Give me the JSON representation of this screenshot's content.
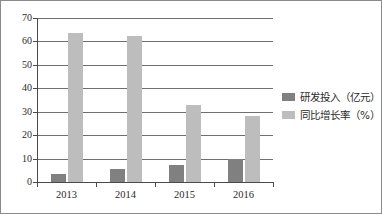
{
  "chart_data": {
    "type": "bar",
    "title": "",
    "subtitle": "",
    "xlabel": "",
    "ylabel": "",
    "categories": [
      "2013",
      "2014",
      "2015",
      "2016"
    ],
    "series": [
      {
        "name": "研发投入（亿元）",
        "color": "#808080",
        "values": [
          3.5,
          5.5,
          7.3,
          9.7
        ]
      },
      {
        "name": "同比增长率（%）",
        "color": "#bdbdbd",
        "values": [
          63.5,
          62.5,
          33,
          28
        ]
      }
    ],
    "ylim": [
      0,
      70
    ],
    "ytick_step": 10,
    "yticks": [
      "0",
      "10",
      "20",
      "30",
      "40",
      "50",
      "60",
      "70"
    ],
    "grid": true,
    "legend_position": "right"
  },
  "legend": {
    "items": [
      {
        "label": "研发投入（亿元）"
      },
      {
        "label": "同比增长率（%）"
      }
    ]
  }
}
